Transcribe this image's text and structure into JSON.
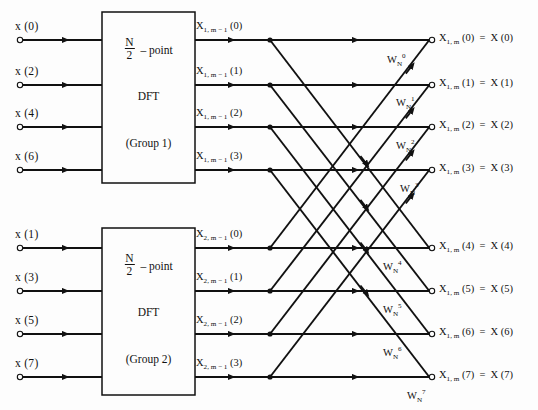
{
  "figure": {
    "type": "fft-butterfly-signal-flow-graph",
    "background": "#fdfdfd",
    "line_color": "#111111",
    "width": 538,
    "height": 410
  },
  "inputs": {
    "group1": [
      {
        "label": "x (0)",
        "y": 40
      },
      {
        "label": "x (2)",
        "y": 85
      },
      {
        "label": "x (4)",
        "y": 127
      },
      {
        "label": "x (6)",
        "y": 170
      }
    ],
    "group2": [
      {
        "label": "x (1)",
        "y": 248
      },
      {
        "label": "x (3)",
        "y": 291
      },
      {
        "label": "x (5)",
        "y": 334
      },
      {
        "label": "x (7)",
        "y": 377
      }
    ]
  },
  "boxes": [
    {
      "name": "dft-group-1",
      "line1_num": "N",
      "line1_den": "2",
      "line1_suffix": "– point",
      "line2": "DFT",
      "line3": "(Group 1)",
      "x": 102,
      "y": 12,
      "w": 93,
      "h": 171
    },
    {
      "name": "dft-group-2",
      "line1_num": "N",
      "line1_den": "2",
      "line1_suffix": "– point",
      "line2": "DFT",
      "line3": "(Group 2)",
      "x": 102,
      "y": 228,
      "w": 93,
      "h": 167
    }
  ],
  "intermediate": {
    "group1": [
      {
        "base": "X",
        "sub": "1, m − 1",
        "arg": "(0)",
        "y": 40
      },
      {
        "base": "X",
        "sub": "1, m − 1",
        "arg": "(1)",
        "y": 85
      },
      {
        "base": "X",
        "sub": "1, m − 1",
        "arg": "(2)",
        "y": 127
      },
      {
        "base": "X",
        "sub": "1, m − 1",
        "arg": "(3)",
        "y": 170
      }
    ],
    "group2": [
      {
        "base": "X",
        "sub": "2, m − 1",
        "arg": "(0)",
        "y": 248
      },
      {
        "base": "X",
        "sub": "2, m − 1",
        "arg": "(1)",
        "y": 291
      },
      {
        "base": "X",
        "sub": "2, m − 1",
        "arg": "(2)",
        "y": 334
      },
      {
        "base": "X",
        "sub": "2, m − 1",
        "arg": "(3)",
        "y": 377
      }
    ]
  },
  "outputs": [
    {
      "base": "X",
      "sub": "1, m",
      "arg": "(0)",
      "eq": "=",
      "result": "X (0)",
      "y": 40
    },
    {
      "base": "X",
      "sub": "1, m",
      "arg": "(1)",
      "eq": "=",
      "result": "X (1)",
      "y": 85
    },
    {
      "base": "X",
      "sub": "1, m",
      "arg": "(2)",
      "eq": "=",
      "result": "X (2)",
      "y": 127
    },
    {
      "base": "X",
      "sub": "1, m",
      "arg": "(3)",
      "eq": "=",
      "result": "X (3)",
      "y": 170
    },
    {
      "base": "X",
      "sub": "1, m",
      "arg": "(4)",
      "eq": "=",
      "result": "X (4)",
      "y": 248
    },
    {
      "base": "X",
      "sub": "1, m",
      "arg": "(5)",
      "eq": "=",
      "result": "X (5)",
      "y": 291
    },
    {
      "base": "X",
      "sub": "1, m",
      "arg": "(6)",
      "eq": "=",
      "result": "X (6)",
      "y": 334
    },
    {
      "base": "X",
      "sub": "1, m",
      "arg": "(7)",
      "eq": "=",
      "result": "X (7)",
      "y": 377
    }
  ],
  "twiddle_factors": [
    {
      "base": "W",
      "sub": "N",
      "sup": "0",
      "x": 387,
      "y": 52
    },
    {
      "base": "W",
      "sub": "N",
      "sup": "1",
      "x": 396,
      "y": 95
    },
    {
      "base": "W",
      "sub": "N",
      "sup": "2",
      "x": 396,
      "y": 138
    },
    {
      "base": "W",
      "sub": "N",
      "sup": "3",
      "x": 400,
      "y": 181
    },
    {
      "base": "W",
      "sub": "N",
      "sup": "4",
      "x": 383,
      "y": 259
    },
    {
      "base": "W",
      "sub": "N",
      "sup": "5",
      "x": 383,
      "y": 302
    },
    {
      "base": "W",
      "sub": "N",
      "sup": "6",
      "x": 383,
      "y": 345
    },
    {
      "base": "W",
      "sub": "N",
      "sup": "7",
      "x": 407,
      "y": 388
    }
  ],
  "geometry": {
    "input_terminal_x": 20,
    "input_line_end": 102,
    "input_arrow_x": 66,
    "mid_line_start": 195,
    "node_x": 270,
    "output_terminal_x": 432,
    "horiz_arrow_x": 356,
    "mid_arrow_x": 232,
    "rows_top": [
      40,
      85,
      127,
      170
    ],
    "rows_bottom": [
      248,
      291,
      334,
      377
    ]
  }
}
